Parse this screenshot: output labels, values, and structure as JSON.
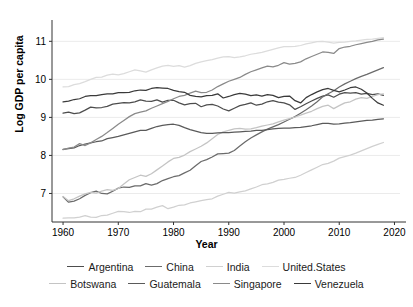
{
  "axis": {
    "ylabel": "Log GDP per capita",
    "xlabel": "Year",
    "yticks": [
      "7",
      "8",
      "9",
      "10",
      "11"
    ],
    "xticks": [
      "1960",
      "1970",
      "1980",
      "1990",
      "2000",
      "2010",
      "2020"
    ]
  },
  "legend": {
    "row1": [
      {
        "label": "Argentina",
        "color": "#4d4d4d"
      },
      {
        "label": "China",
        "color": "#6b6b6b"
      },
      {
        "label": "India",
        "color": "#d0d0d0"
      },
      {
        "label": "United.States",
        "color": "#dcdcdc"
      }
    ],
    "row2": [
      {
        "label": "Botswana",
        "color": "#c4c4c4"
      },
      {
        "label": "Guatemala",
        "color": "#5a5a5a"
      },
      {
        "label": "Singapore",
        "color": "#8a8a8a"
      },
      {
        "label": "Venezuela",
        "color": "#3a3a3a"
      }
    ]
  },
  "chart_data": {
    "type": "line",
    "title": "",
    "xlabel": "Year",
    "ylabel": "Log GDP per capita",
    "xlim": [
      1958,
      2021
    ],
    "ylim": [
      6.25,
      11.35
    ],
    "yticks": [
      7,
      8,
      9,
      10,
      11
    ],
    "xticks": [
      1960,
      1970,
      1980,
      1990,
      2000,
      2010,
      2020
    ],
    "grid": true,
    "legend_position": "bottom",
    "x": [
      1960,
      1961,
      1962,
      1963,
      1964,
      1965,
      1966,
      1967,
      1968,
      1969,
      1970,
      1971,
      1972,
      1973,
      1974,
      1975,
      1976,
      1977,
      1978,
      1979,
      1980,
      1981,
      1982,
      1983,
      1984,
      1985,
      1986,
      1987,
      1988,
      1989,
      1990,
      1991,
      1992,
      1993,
      1994,
      1995,
      1996,
      1997,
      1998,
      1999,
      2000,
      2001,
      2002,
      2003,
      2004,
      2005,
      2006,
      2007,
      2008,
      2009,
      2010,
      2011,
      2012,
      2013,
      2014,
      2015,
      2016,
      2017,
      2018
    ],
    "series": [
      {
        "name": "Argentina",
        "color": "#4d4d4d",
        "values": [
          9.11,
          9.14,
          9.1,
          9.12,
          9.19,
          9.27,
          9.25,
          9.26,
          9.29,
          9.35,
          9.37,
          9.39,
          9.38,
          9.41,
          9.46,
          9.43,
          9.42,
          9.46,
          9.4,
          9.45,
          9.45,
          9.38,
          9.33,
          9.36,
          9.37,
          9.28,
          9.33,
          9.34,
          9.3,
          9.22,
          9.17,
          9.24,
          9.31,
          9.34,
          9.38,
          9.32,
          9.35,
          9.41,
          9.44,
          9.4,
          9.38,
          9.33,
          9.21,
          9.28,
          9.36,
          9.43,
          9.5,
          9.56,
          9.59,
          9.53,
          9.61,
          9.65,
          9.64,
          9.65,
          9.61,
          9.63,
          9.6,
          9.62,
          9.58
        ]
      },
      {
        "name": "China",
        "color": "#6b6b6b",
        "values": [
          6.91,
          6.77,
          6.8,
          6.86,
          6.95,
          7.02,
          7.06,
          7.0,
          6.99,
          7.06,
          7.14,
          7.17,
          7.16,
          7.2,
          7.2,
          7.26,
          7.22,
          7.26,
          7.34,
          7.39,
          7.44,
          7.47,
          7.54,
          7.61,
          7.73,
          7.84,
          7.89,
          7.96,
          8.04,
          8.05,
          8.06,
          8.13,
          8.25,
          8.36,
          8.46,
          8.54,
          8.62,
          8.69,
          8.75,
          8.81,
          8.88,
          8.95,
          9.02,
          9.11,
          9.2,
          9.3,
          9.41,
          9.54,
          9.62,
          9.7,
          9.8,
          9.88,
          9.95,
          10.02,
          10.08,
          10.13,
          10.19,
          10.25,
          10.31
        ]
      },
      {
        "name": "India",
        "color": "#d0d0d0",
        "values": [
          6.35,
          6.36,
          6.36,
          6.38,
          6.42,
          6.38,
          6.37,
          6.42,
          6.43,
          6.48,
          6.53,
          6.52,
          6.5,
          6.53,
          6.52,
          6.59,
          6.59,
          6.64,
          6.68,
          6.6,
          6.64,
          6.69,
          6.7,
          6.75,
          6.78,
          6.81,
          6.84,
          6.86,
          6.93,
          6.98,
          7.03,
          7.01,
          7.04,
          7.07,
          7.12,
          7.17,
          7.23,
          7.25,
          7.29,
          7.35,
          7.37,
          7.4,
          7.42,
          7.48,
          7.55,
          7.62,
          7.69,
          7.76,
          7.79,
          7.85,
          7.93,
          7.97,
          8.01,
          8.06,
          8.12,
          8.18,
          8.24,
          8.29,
          8.34
        ]
      },
      {
        "name": "United.States",
        "color": "#dcdcdc",
        "values": [
          9.8,
          9.81,
          9.86,
          9.89,
          9.94,
          10.0,
          10.05,
          10.06,
          10.11,
          10.14,
          10.12,
          10.15,
          10.2,
          10.25,
          10.22,
          10.19,
          10.25,
          10.3,
          10.35,
          10.37,
          10.34,
          10.36,
          10.32,
          10.36,
          10.42,
          10.46,
          10.49,
          10.52,
          10.56,
          10.59,
          10.6,
          10.57,
          10.59,
          10.62,
          10.66,
          10.68,
          10.71,
          10.75,
          10.79,
          10.83,
          10.86,
          10.86,
          10.87,
          10.89,
          10.93,
          10.96,
          10.99,
          11.0,
          10.98,
          10.95,
          10.97,
          10.98,
          11.0,
          11.01,
          11.03,
          11.05,
          11.06,
          11.08,
          11.1
        ]
      },
      {
        "name": "Botswana",
        "color": "#c4c4c4",
        "values": [
          6.92,
          6.81,
          6.86,
          6.93,
          6.99,
          7.03,
          7.01,
          7.06,
          7.1,
          7.08,
          7.13,
          7.25,
          7.36,
          7.42,
          7.48,
          7.45,
          7.52,
          7.62,
          7.72,
          7.83,
          7.92,
          7.95,
          8.01,
          8.1,
          8.17,
          8.24,
          8.33,
          8.44,
          8.55,
          8.62,
          8.66,
          8.7,
          8.71,
          8.69,
          8.7,
          8.73,
          8.77,
          8.8,
          8.83,
          8.88,
          8.93,
          8.97,
          9.01,
          9.06,
          9.11,
          9.16,
          9.23,
          9.29,
          9.32,
          9.23,
          9.31,
          9.38,
          9.41,
          9.48,
          9.52,
          9.5,
          9.55,
          9.6,
          9.62
        ]
      },
      {
        "name": "Guatemala",
        "color": "#5a5a5a",
        "values": [
          8.16,
          8.18,
          8.2,
          8.26,
          8.3,
          8.33,
          8.36,
          8.38,
          8.44,
          8.47,
          8.5,
          8.54,
          8.58,
          8.62,
          8.66,
          8.66,
          8.71,
          8.76,
          8.79,
          8.81,
          8.82,
          8.79,
          8.73,
          8.68,
          8.64,
          8.6,
          8.58,
          8.58,
          8.59,
          8.6,
          8.6,
          8.61,
          8.62,
          8.63,
          8.64,
          8.66,
          8.66,
          8.68,
          8.7,
          8.71,
          8.72,
          8.72,
          8.73,
          8.74,
          8.76,
          8.78,
          8.81,
          8.84,
          8.84,
          8.82,
          8.83,
          8.85,
          8.86,
          8.88,
          8.9,
          8.92,
          8.93,
          8.95,
          8.96
        ]
      },
      {
        "name": "Singapore",
        "color": "#8a8a8a",
        "values": [
          8.15,
          8.19,
          8.22,
          8.31,
          8.26,
          8.33,
          8.42,
          8.5,
          8.6,
          8.71,
          8.82,
          8.92,
          9.02,
          9.1,
          9.14,
          9.17,
          9.24,
          9.3,
          9.36,
          9.42,
          9.49,
          9.55,
          9.58,
          9.64,
          9.69,
          9.65,
          9.66,
          9.72,
          9.81,
          9.88,
          9.95,
          10.0,
          10.05,
          10.13,
          10.2,
          10.25,
          10.3,
          10.35,
          10.33,
          10.37,
          10.44,
          10.4,
          10.42,
          10.46,
          10.54,
          10.6,
          10.66,
          10.72,
          10.71,
          10.68,
          10.81,
          10.85,
          10.87,
          10.91,
          10.94,
          10.97,
          11.0,
          11.04,
          11.06
        ]
      },
      {
        "name": "Venezuela",
        "color": "#3a3a3a",
        "values": [
          9.41,
          9.43,
          9.47,
          9.49,
          9.55,
          9.57,
          9.57,
          9.6,
          9.62,
          9.62,
          9.65,
          9.65,
          9.66,
          9.7,
          9.72,
          9.71,
          9.76,
          9.78,
          9.77,
          9.76,
          9.71,
          9.68,
          9.66,
          9.58,
          9.55,
          9.54,
          9.57,
          9.58,
          9.62,
          9.51,
          9.55,
          9.6,
          9.63,
          9.61,
          9.57,
          9.59,
          9.56,
          9.6,
          9.58,
          9.52,
          9.55,
          9.56,
          9.44,
          9.38,
          9.52,
          9.6,
          9.67,
          9.73,
          9.76,
          9.71,
          9.67,
          9.72,
          9.78,
          9.8,
          9.74,
          9.64,
          9.5,
          9.38,
          9.32
        ]
      }
    ]
  }
}
